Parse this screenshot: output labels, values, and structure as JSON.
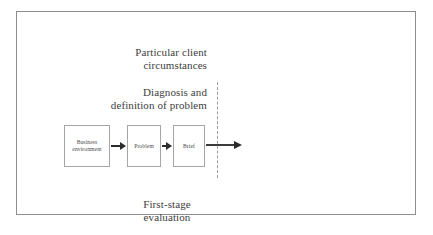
{
  "figure": {
    "labels": {
      "client": {
        "line1": "Particular client",
        "line2": "circumstances"
      },
      "diagnosis": {
        "line1": "Diagnosis and",
        "line2": "definition of problem"
      },
      "evaluation": {
        "line1": "First-stage",
        "line2": "evaluation"
      }
    },
    "boxes": [
      {
        "id": "business",
        "line1": "Business",
        "line2": "environment"
      },
      {
        "id": "problem",
        "line1": "Problem",
        "line2": ""
      },
      {
        "id": "brief",
        "line1": "Brief",
        "line2": ""
      }
    ],
    "colors": {
      "frame_border": "#8e8e8e",
      "box_border": "#a6a6a6",
      "arrow": "#2b2b2b",
      "divider": "#9b9b9b",
      "text": "#3d3d3d",
      "background": "#ffffff"
    }
  }
}
